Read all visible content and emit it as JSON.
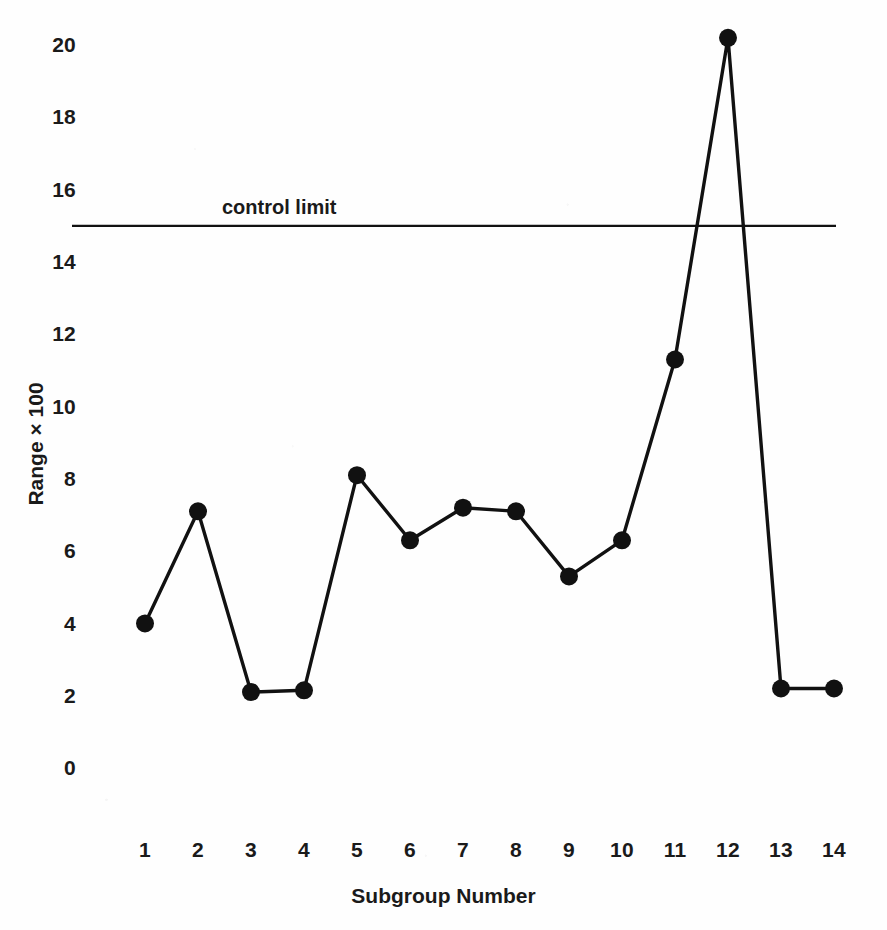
{
  "chart_data": {
    "type": "line",
    "title": "",
    "xlabel": "Subgroup Number",
    "ylabel": "Range × 100",
    "categories": [
      "1",
      "2",
      "3",
      "4",
      "5",
      "6",
      "7",
      "8",
      "9",
      "10",
      "11",
      "12",
      "13",
      "14"
    ],
    "x": [
      1,
      2,
      3,
      4,
      5,
      6,
      7,
      8,
      9,
      10,
      11,
      12,
      13,
      14
    ],
    "values": [
      4.0,
      7.1,
      2.1,
      2.15,
      8.1,
      6.3,
      7.2,
      7.1,
      5.3,
      6.3,
      11.3,
      20.2,
      2.2,
      2.2
    ],
    "series": [
      {
        "name": "Range",
        "values": [
          4.0,
          7.1,
          2.1,
          2.15,
          8.1,
          6.3,
          7.2,
          7.1,
          5.3,
          6.3,
          11.3,
          20.2,
          2.2,
          2.2
        ],
        "marker": "filled-circle",
        "color": "#111111"
      }
    ],
    "ylim": [
      0,
      20.8
    ],
    "yticks": [
      0,
      2,
      4,
      6,
      8,
      10,
      12,
      14,
      16,
      18,
      20
    ],
    "ytick_labels": [
      "0",
      "2",
      "4",
      "6",
      "8",
      "10",
      "12",
      "14",
      "16",
      "18",
      "20"
    ],
    "xlim": [
      0.55,
      14.45
    ],
    "grid": false,
    "legend": false,
    "annotations": [
      {
        "name": "control-limit",
        "type": "hline",
        "value": 15.0,
        "label": "control limit",
        "color": "#111111"
      }
    ]
  },
  "axis": {
    "y_title": "Range × 100",
    "x_title": "Subgroup Number"
  },
  "annotation": {
    "control_limit_label": "control limit"
  },
  "colors": {
    "line": "#111111",
    "marker": "#111111",
    "control_limit": "#111111",
    "text": "#1a1a1a",
    "background": "#fefefe"
  }
}
